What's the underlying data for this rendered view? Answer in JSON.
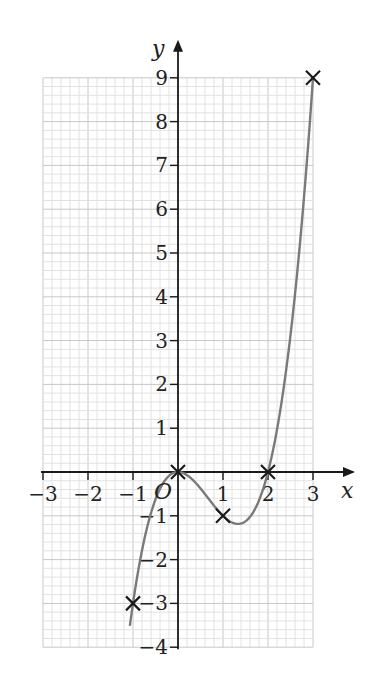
{
  "chart_data": {
    "type": "line",
    "title": "",
    "function": "y = x^3 - 2x^2",
    "xlabel": "x",
    "ylabel": "y",
    "xlim": [
      -3,
      3
    ],
    "ylim": [
      -4,
      9
    ],
    "x_ticks": [
      -3,
      -2,
      -1,
      1,
      2,
      3
    ],
    "x_tick_labels": [
      "−3",
      "−2",
      "−1",
      "1",
      "2",
      "3"
    ],
    "y_ticks": [
      -4,
      -3,
      -2,
      -1,
      1,
      2,
      3,
      4,
      5,
      6,
      7,
      8,
      9
    ],
    "y_tick_labels": [
      "−4",
      "−3",
      "−2",
      "−1",
      "1",
      "2",
      "3",
      "4",
      "5",
      "6",
      "7",
      "8",
      "9"
    ],
    "origin_label": "O",
    "grid": true,
    "grid_minor_per_unit": 5,
    "marked_points": [
      {
        "x": -1,
        "y": -3
      },
      {
        "x": 0,
        "y": 0
      },
      {
        "x": 1,
        "y": -1
      },
      {
        "x": 2,
        "y": 0
      },
      {
        "x": 3,
        "y": 9
      }
    ],
    "series": [
      {
        "name": "curve",
        "x": [
          -1.05,
          -1,
          -0.75,
          -0.5,
          -0.25,
          0,
          0.25,
          0.5,
          0.75,
          1,
          1.25,
          1.5,
          1.75,
          2,
          2.25,
          2.5,
          2.75,
          3
        ],
        "values": [
          -3.36,
          -3,
          -1.55,
          -0.625,
          -0.14,
          0,
          -0.11,
          -0.375,
          -0.7,
          -1,
          -1.17,
          -1.125,
          -0.77,
          0,
          1.27,
          3.125,
          5.67,
          9
        ]
      }
    ]
  },
  "colors": {
    "curve": "#7a7a7a",
    "axes": "#1a1a1a",
    "grid_minor": "#e2e2e2",
    "grid_major": "#c8c8c8",
    "marker": "#1a1a1a"
  }
}
